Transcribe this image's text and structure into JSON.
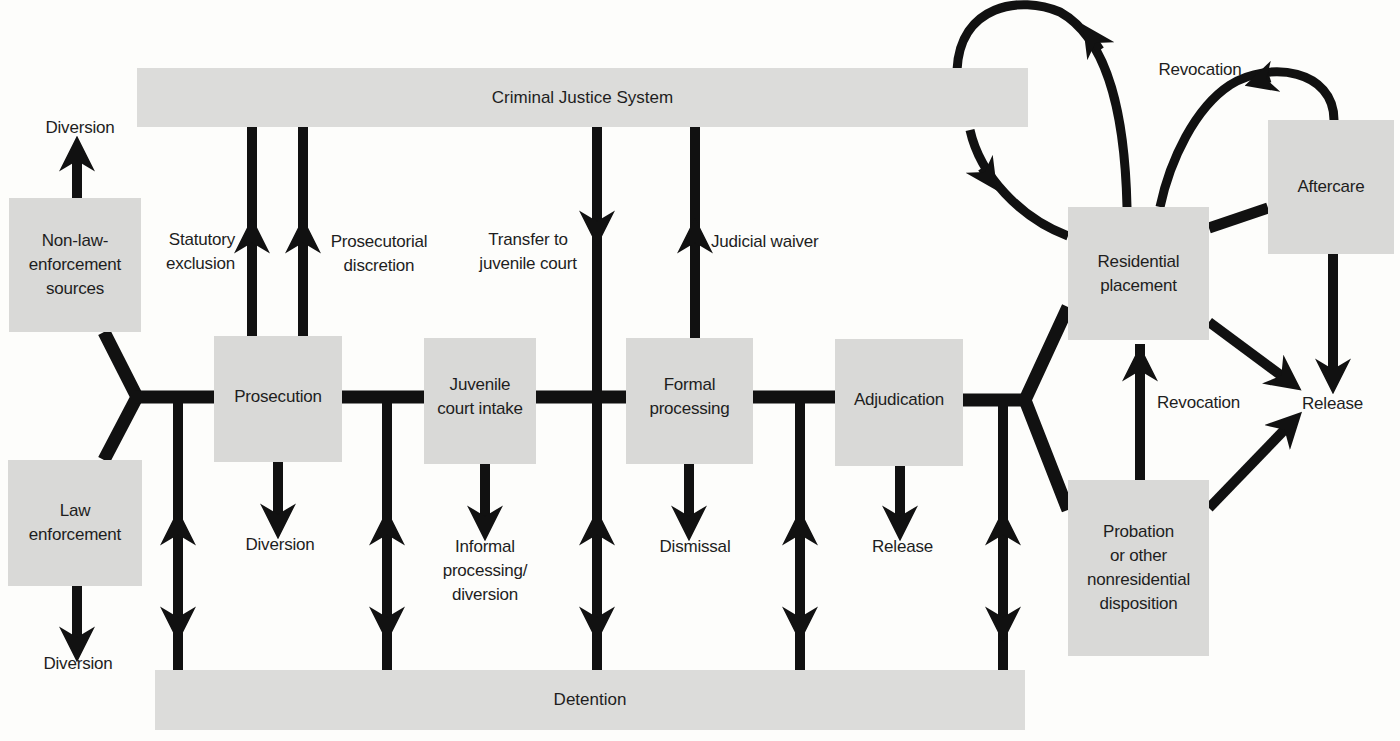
{
  "diagram": {
    "bars": {
      "criminal_justice_system": "Criminal Justice System",
      "detention": "Detention"
    },
    "nodes": {
      "non_law_enforcement": "Non-law-\nenforcement\nsources",
      "law_enforcement": "Law\nenforcement",
      "prosecution": "Prosecution",
      "juvenile_court_intake": "Juvenile\ncourt intake",
      "formal_processing": "Formal\nprocessing",
      "adjudication": "Adjudication",
      "residential_placement": "Residential\nplacement",
      "aftercare": "Aftercare",
      "probation": "Probation\nor other\nnonresidential\ndisposition"
    },
    "labels": {
      "diversion_top": "Diversion",
      "diversion_bottom": "Diversion",
      "statutory_exclusion": "Statutory\nexclusion",
      "prosecutorial_discretion": "Prosecutorial\ndiscretion",
      "transfer_to_juvenile_court": "Transfer to\njuvenile court",
      "judicial_waiver": "Judicial waiver",
      "prosecution_diversion": "Diversion",
      "informal_processing": "Informal\nprocessing/\ndiversion",
      "dismissal": "Dismissal",
      "adjudication_release": "Release",
      "revocation_top": "Revocation",
      "revocation_mid": "Revocation",
      "final_release": "Release"
    },
    "colors": {
      "box_fill": "#d9d9d7",
      "line": "#111111",
      "background": "#fdfdfb"
    }
  }
}
